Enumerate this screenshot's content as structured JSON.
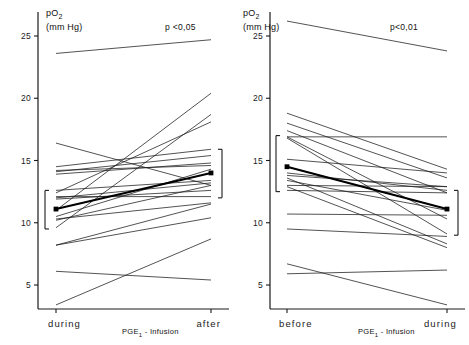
{
  "figure": {
    "type": "paired-slope-chart",
    "n_panels": 2
  },
  "chart_data": [
    {
      "type": "line",
      "panel": "left",
      "title": "",
      "ylabel_main": "pO",
      "ylabel_sub": "2",
      "ylabel_unit": "(mm Hg)",
      "xlabel": "PGE",
      "xlabel_sub": "1",
      "xlabel_rest": " - Infusion",
      "annotation": "p <0,05",
      "categories": [
        "during",
        "after"
      ],
      "ylim": [
        0,
        27
      ],
      "yticks": [
        5,
        10,
        15,
        20,
        25
      ],
      "ytick_labels": [
        "5",
        "10",
        "15",
        "20",
        "25"
      ],
      "grid": false,
      "legend": "none",
      "series": [
        {
          "name": "s1",
          "values": [
            23.6,
            24.7
          ]
        },
        {
          "name": "s2",
          "values": [
            11.0,
            20.4
          ]
        },
        {
          "name": "s3",
          "values": [
            9.6,
            18.7
          ]
        },
        {
          "name": "s4",
          "values": [
            12.4,
            18.1
          ]
        },
        {
          "name": "s5",
          "values": [
            16.4,
            13.0
          ]
        },
        {
          "name": "s6",
          "values": [
            14.5,
            15.9
          ]
        },
        {
          "name": "s7",
          "values": [
            14.1,
            15.4
          ]
        },
        {
          "name": "s8",
          "values": [
            13.9,
            14.8
          ]
        },
        {
          "name": "s9",
          "values": [
            14.2,
            14.6
          ]
        },
        {
          "name": "s10",
          "values": [
            10.5,
            14.3
          ]
        },
        {
          "name": "s11",
          "values": [
            12.6,
            13.4
          ]
        },
        {
          "name": "s12",
          "values": [
            12.0,
            13.2
          ]
        },
        {
          "name": "s13",
          "values": [
            10.2,
            13.0
          ]
        },
        {
          "name": "s14",
          "values": [
            11.9,
            12.6
          ]
        },
        {
          "name": "s15",
          "values": [
            12.1,
            12.1
          ]
        },
        {
          "name": "s16",
          "values": [
            10.3,
            11.6
          ]
        },
        {
          "name": "s17",
          "values": [
            8.2,
            11.5
          ]
        },
        {
          "name": "s18",
          "values": [
            8.2,
            10.4
          ]
        },
        {
          "name": "s19",
          "values": [
            3.4,
            8.7
          ]
        },
        {
          "name": "s20",
          "values": [
            6.1,
            5.4
          ]
        }
      ],
      "mean_series": {
        "name": "mean",
        "values": [
          11.1,
          14.0
        ],
        "marker": "square"
      },
      "error_bars": [
        {
          "x_category": "during",
          "low": 9.5,
          "high": 12.6
        },
        {
          "x_category": "after",
          "low": 12.0,
          "high": 15.9
        }
      ]
    },
    {
      "type": "line",
      "panel": "right",
      "title": "",
      "ylabel_main": "pO",
      "ylabel_sub": "2",
      "ylabel_unit": "(mm Hg)",
      "xlabel": "PGE",
      "xlabel_sub": "1",
      "xlabel_rest": " - Infusion",
      "annotation": "p<0,01",
      "categories": [
        "before",
        "during"
      ],
      "ylim": [
        0,
        27
      ],
      "yticks": [
        5,
        10,
        15,
        20,
        25
      ],
      "ytick_labels": [
        "5",
        "10",
        "15",
        "20",
        "25"
      ],
      "grid": false,
      "legend": "none",
      "series": [
        {
          "name": "s1",
          "values": [
            26.2,
            23.8
          ]
        },
        {
          "name": "s2",
          "values": [
            18.8,
            14.3
          ]
        },
        {
          "name": "s3",
          "values": [
            18.0,
            13.6
          ]
        },
        {
          "name": "s4",
          "values": [
            17.4,
            12.4
          ]
        },
        {
          "name": "s5",
          "values": [
            16.9,
            16.9
          ]
        },
        {
          "name": "s6",
          "values": [
            16.9,
            10.3
          ]
        },
        {
          "name": "s7",
          "values": [
            16.8,
            9.1
          ]
        },
        {
          "name": "s8",
          "values": [
            15.1,
            14.0
          ]
        },
        {
          "name": "s9",
          "values": [
            14.5,
            11.1
          ]
        },
        {
          "name": "s10",
          "values": [
            14.0,
            12.6
          ]
        },
        {
          "name": "s11",
          "values": [
            13.8,
            12.9
          ]
        },
        {
          "name": "s12",
          "values": [
            13.6,
            8.3
          ]
        },
        {
          "name": "s13",
          "values": [
            13.4,
            11.0
          ]
        },
        {
          "name": "s14",
          "values": [
            13.0,
            12.9
          ]
        },
        {
          "name": "s15",
          "values": [
            12.9,
            8.0
          ]
        },
        {
          "name": "s16",
          "values": [
            12.6,
            12.4
          ]
        },
        {
          "name": "s17",
          "values": [
            10.7,
            10.6
          ]
        },
        {
          "name": "s18",
          "values": [
            9.5,
            8.9
          ]
        },
        {
          "name": "s19",
          "values": [
            6.7,
            3.4
          ]
        },
        {
          "name": "s20",
          "values": [
            5.9,
            6.2
          ]
        }
      ],
      "mean_series": {
        "name": "mean",
        "values": [
          14.5,
          11.1
        ],
        "marker": "square"
      },
      "error_bars": [
        {
          "x_category": "before",
          "low": 12.5,
          "high": 17.0
        },
        {
          "x_category": "during",
          "low": 9.0,
          "high": 12.6
        }
      ]
    }
  ],
  "style": {
    "line_color": "#1a1a1a",
    "mean_color": "#000000",
    "axis_color": "#1a1a1a",
    "background": "#ffffff"
  }
}
